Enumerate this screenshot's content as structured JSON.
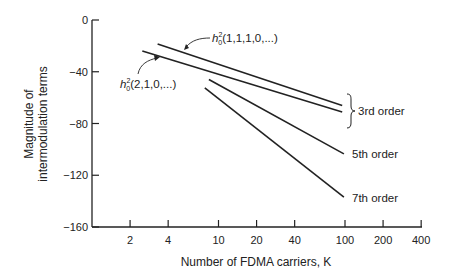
{
  "chart_data": {
    "type": "line",
    "title": "",
    "xlabel": "Number of FDMA carriers, K",
    "ylabel": "Magnitude of intermodulation terms",
    "ylabel_lines": [
      "Magnitude of",
      "intermodulation terms"
    ],
    "x_scale": "log",
    "xlim": [
      1,
      400
    ],
    "ylim": [
      -160,
      0
    ],
    "x_ticks": [
      2,
      4,
      10,
      20,
      40,
      100,
      200,
      400
    ],
    "x_tick_labels": [
      "2",
      "4",
      "10",
      "20",
      "40",
      "100",
      "200",
      "400"
    ],
    "y_ticks": [
      0,
      -40,
      -80,
      -120,
      -160
    ],
    "y_tick_labels": [
      "0",
      "−40",
      "−80",
      "−120",
      "−160"
    ],
    "grid": false,
    "legend": "none (inline annotations)",
    "series": [
      {
        "name": "h0^2(1,1,1,0,...)",
        "group": "3rd order",
        "x": [
          3.3,
          95
        ],
        "y": [
          -18.5,
          -66
        ]
      },
      {
        "name": "h0^2(2,1,0,...)",
        "group": "3rd order",
        "x": [
          2.5,
          95
        ],
        "y": [
          -24,
          -71
        ]
      },
      {
        "name": "5th order",
        "x": [
          8.4,
          98
        ],
        "y": [
          -46,
          -103.5
        ]
      },
      {
        "name": "7th order",
        "x": [
          7.8,
          98
        ],
        "y": [
          -52.5,
          -137
        ]
      }
    ],
    "annotations": [
      {
        "text_base": "h",
        "sup": "2",
        "sub": "0",
        "args": "(1,1,1,0,...)",
        "points_to": "upper 3rd order line"
      },
      {
        "text_base": "h",
        "sup": "2",
        "sub": "0",
        "args": "(2,1,0,...)",
        "points_to": "lower 3rd order line"
      },
      {
        "text": "3rd order",
        "brace": true
      },
      {
        "text": "5th order"
      },
      {
        "text": "7th order"
      }
    ]
  },
  "labels": {
    "ann_upper_base": "h",
    "ann_upper_sup": "2",
    "ann_upper_sub": "0",
    "ann_upper_args": "(1,1,1,0,...)",
    "ann_lower_base": "h",
    "ann_lower_sup": "2",
    "ann_lower_sub": "0",
    "ann_lower_args": "(2,1,0,...)",
    "third": "3rd order",
    "fifth": "5th order",
    "seventh": "7th order"
  }
}
